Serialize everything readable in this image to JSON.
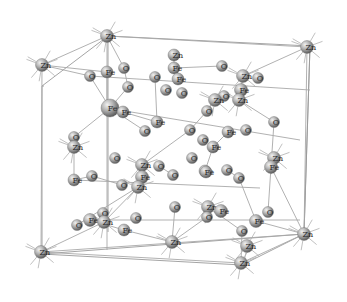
{
  "diagram": {
    "title": "",
    "type": "crystal-structure",
    "elements": [
      "Zn",
      "Fe",
      "O"
    ],
    "colors": {
      "background": "#ffffff",
      "atom_light": "#e6e6e6",
      "atom_mid": "#a6a6a6",
      "atom_dark": "#5e5e5e",
      "line": "#a0a0a0",
      "label": "#2a2a2a"
    },
    "cell_box": {
      "front": [
        [
          42,
          86
        ],
        [
          108,
          60
        ],
        [
          108,
          260
        ],
        [
          42,
          280
        ]
      ],
      "back": [
        [
          108,
          34
        ],
        [
          310,
          46
        ],
        [
          310,
          232
        ],
        [
          108,
          232
        ]
      ],
      "corners": [
        [
          42,
          86
        ],
        [
          108,
          36
        ],
        [
          310,
          46
        ],
        [
          42,
          254
        ],
        [
          242,
          265
        ],
        [
          304,
          234
        ]
      ]
    },
    "atoms": [
      {
        "el": "Zn",
        "x": 107,
        "y": 36,
        "r": 6.5
      },
      {
        "el": "Zn",
        "x": 42,
        "y": 65,
        "r": 6.5
      },
      {
        "el": "Zn",
        "x": 307,
        "y": 47,
        "r": 6.5
      },
      {
        "el": "Zn",
        "x": 41,
        "y": 252,
        "r": 6.5
      },
      {
        "el": "Zn",
        "x": 241,
        "y": 263,
        "r": 6.5
      },
      {
        "el": "Zn",
        "x": 304,
        "y": 234,
        "r": 6.5
      },
      {
        "el": "O",
        "x": 90,
        "y": 76,
        "r": 5.5
      },
      {
        "el": "Fe",
        "x": 107,
        "y": 72,
        "r": 6
      },
      {
        "el": "O",
        "x": 124,
        "y": 68,
        "r": 5.5
      },
      {
        "el": "O",
        "x": 128,
        "y": 87,
        "r": 5.5
      },
      {
        "el": "Fe",
        "x": 110,
        "y": 108,
        "r": 9
      },
      {
        "el": "Fe",
        "x": 123,
        "y": 112,
        "r": 6
      },
      {
        "el": "O",
        "x": 155,
        "y": 77,
        "r": 5.5
      },
      {
        "el": "O",
        "x": 145,
        "y": 131,
        "r": 5.5
      },
      {
        "el": "Fe",
        "x": 157,
        "y": 122,
        "r": 6
      },
      {
        "el": "Zn",
        "x": 174,
        "y": 55,
        "r": 6
      },
      {
        "el": "Fe",
        "x": 174,
        "y": 68,
        "r": 6
      },
      {
        "el": "O",
        "x": 182,
        "y": 93,
        "r": 5.5
      },
      {
        "el": "O",
        "x": 166,
        "y": 90,
        "r": 5.5
      },
      {
        "el": "Fe",
        "x": 178,
        "y": 79,
        "r": 6
      },
      {
        "el": "O",
        "x": 222,
        "y": 66,
        "r": 5.5
      },
      {
        "el": "Zn",
        "x": 243,
        "y": 76,
        "r": 6.5
      },
      {
        "el": "O",
        "x": 258,
        "y": 78,
        "r": 5.5
      },
      {
        "el": "Fe",
        "x": 241,
        "y": 90,
        "r": 6.5
      },
      {
        "el": "Zn",
        "x": 239,
        "y": 100,
        "r": 6.5
      },
      {
        "el": "O",
        "x": 224,
        "y": 96,
        "r": 5.5
      },
      {
        "el": "O",
        "x": 274,
        "y": 122,
        "r": 5.5
      },
      {
        "el": "O",
        "x": 207,
        "y": 111,
        "r": 5.5
      },
      {
        "el": "Zn",
        "x": 215,
        "y": 100,
        "r": 6.5
      },
      {
        "el": "Fe",
        "x": 228,
        "y": 132,
        "r": 6
      },
      {
        "el": "O",
        "x": 190,
        "y": 130,
        "r": 5.5
      },
      {
        "el": "O",
        "x": 246,
        "y": 130,
        "r": 5.5
      },
      {
        "el": "Fe",
        "x": 213,
        "y": 147,
        "r": 6
      },
      {
        "el": "O",
        "x": 203,
        "y": 140,
        "r": 5.5
      },
      {
        "el": "O",
        "x": 74,
        "y": 137,
        "r": 5.5
      },
      {
        "el": "Zn",
        "x": 74,
        "y": 147,
        "r": 6.5
      },
      {
        "el": "Fe",
        "x": 74,
        "y": 180,
        "r": 6
      },
      {
        "el": "O",
        "x": 92,
        "y": 176,
        "r": 5.5
      },
      {
        "el": "O",
        "x": 122,
        "y": 185,
        "r": 5.5
      },
      {
        "el": "Zn",
        "x": 142,
        "y": 165,
        "r": 6.5
      },
      {
        "el": "O",
        "x": 159,
        "y": 166,
        "r": 5.5
      },
      {
        "el": "Fe",
        "x": 142,
        "y": 177,
        "r": 6.5
      },
      {
        "el": "Zn",
        "x": 138,
        "y": 187,
        "r": 6.5
      },
      {
        "el": "O",
        "x": 115,
        "y": 158,
        "r": 5.5
      },
      {
        "el": "O",
        "x": 173,
        "y": 175,
        "r": 5.5
      },
      {
        "el": "Fe",
        "x": 205,
        "y": 171,
        "r": 6
      },
      {
        "el": "O",
        "x": 192,
        "y": 158,
        "r": 5.5
      },
      {
        "el": "Fe",
        "x": 206,
        "y": 172,
        "r": 6
      },
      {
        "el": "O",
        "x": 227,
        "y": 170,
        "r": 5.5
      },
      {
        "el": "Zn",
        "x": 274,
        "y": 158,
        "r": 6.5
      },
      {
        "el": "Fe",
        "x": 271,
        "y": 167,
        "r": 6.5
      },
      {
        "el": "O",
        "x": 239,
        "y": 178,
        "r": 5.5
      },
      {
        "el": "O",
        "x": 77,
        "y": 225,
        "r": 5.5
      },
      {
        "el": "Fe",
        "x": 90,
        "y": 220,
        "r": 6.5
      },
      {
        "el": "O",
        "x": 103,
        "y": 213,
        "r": 5.5
      },
      {
        "el": "Zn",
        "x": 104,
        "y": 222,
        "r": 6.5
      },
      {
        "el": "Fe",
        "x": 124,
        "y": 230,
        "r": 6
      },
      {
        "el": "O",
        "x": 136,
        "y": 218,
        "r": 5.5
      },
      {
        "el": "O",
        "x": 175,
        "y": 207,
        "r": 5.5
      },
      {
        "el": "Zn",
        "x": 208,
        "y": 207,
        "r": 6.5
      },
      {
        "el": "O",
        "x": 207,
        "y": 217,
        "r": 5.5
      },
      {
        "el": "Fe",
        "x": 221,
        "y": 211,
        "r": 6.5
      },
      {
        "el": "O",
        "x": 242,
        "y": 231,
        "r": 5.5
      },
      {
        "el": "Fe",
        "x": 256,
        "y": 221,
        "r": 6.5
      },
      {
        "el": "O",
        "x": 268,
        "y": 212,
        "r": 5.5
      },
      {
        "el": "Zn",
        "x": 172,
        "y": 242,
        "r": 6.5
      },
      {
        "el": "Zn",
        "x": 247,
        "y": 246,
        "r": 6.5
      }
    ],
    "bonds": [
      [
        107,
        36,
        42,
        65
      ],
      [
        107,
        36,
        307,
        47
      ],
      [
        42,
        65,
        41,
        252
      ],
      [
        107,
        36,
        107,
        250
      ],
      [
        307,
        47,
        304,
        234
      ],
      [
        41,
        252,
        304,
        234
      ],
      [
        41,
        252,
        241,
        263
      ],
      [
        241,
        263,
        304,
        234
      ],
      [
        107,
        36,
        124,
        68
      ],
      [
        42,
        65,
        90,
        76
      ],
      [
        42,
        65,
        107,
        72
      ],
      [
        90,
        76,
        110,
        108
      ],
      [
        107,
        72,
        107,
        108
      ],
      [
        124,
        68,
        128,
        87
      ],
      [
        128,
        87,
        110,
        108
      ],
      [
        110,
        108,
        74,
        137
      ],
      [
        110,
        108,
        145,
        131
      ],
      [
        123,
        112,
        157,
        122
      ],
      [
        155,
        77,
        157,
        122
      ],
      [
        174,
        55,
        174,
        68
      ],
      [
        174,
        68,
        222,
        66
      ],
      [
        307,
        47,
        243,
        76
      ],
      [
        243,
        76,
        241,
        90
      ],
      [
        241,
        90,
        239,
        100
      ],
      [
        239,
        100,
        274,
        122
      ],
      [
        274,
        122,
        271,
        167
      ],
      [
        215,
        100,
        207,
        111
      ],
      [
        207,
        111,
        190,
        130
      ],
      [
        228,
        132,
        213,
        147
      ],
      [
        213,
        147,
        205,
        171
      ],
      [
        190,
        130,
        142,
        165
      ],
      [
        142,
        165,
        142,
        177
      ],
      [
        142,
        177,
        138,
        187
      ],
      [
        159,
        166,
        173,
        175
      ],
      [
        74,
        137,
        74,
        147
      ],
      [
        74,
        147,
        74,
        180
      ],
      [
        74,
        180,
        92,
        176
      ],
      [
        92,
        176,
        122,
        185
      ],
      [
        138,
        187,
        77,
        225
      ],
      [
        138,
        187,
        104,
        222
      ],
      [
        104,
        222,
        41,
        252
      ],
      [
        90,
        220,
        124,
        230
      ],
      [
        124,
        230,
        172,
        242
      ],
      [
        172,
        242,
        207,
        217
      ],
      [
        207,
        217,
        208,
        207
      ],
      [
        208,
        207,
        242,
        231
      ],
      [
        242,
        231,
        241,
        263
      ],
      [
        256,
        221,
        304,
        234
      ],
      [
        268,
        212,
        271,
        167
      ],
      [
        271,
        167,
        304,
        234
      ],
      [
        175,
        207,
        172,
        242
      ],
      [
        227,
        170,
        239,
        178
      ],
      [
        239,
        178,
        256,
        221
      ],
      [
        90,
        76,
        310,
        90
      ],
      [
        107,
        108,
        300,
        140
      ],
      [
        74,
        180,
        260,
        188
      ],
      [
        90,
        220,
        300,
        220
      ]
    ],
    "stubs_at": [
      "Zn"
    ]
  }
}
